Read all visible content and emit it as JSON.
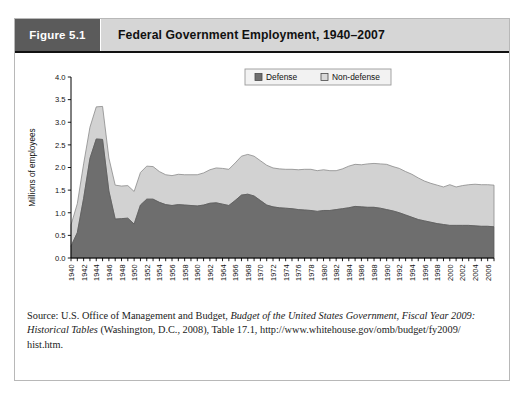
{
  "figure": {
    "badge_label": "Figure 5.1",
    "title": "Federal Government Employment, 1940–2007"
  },
  "source": {
    "line1_prefix": "Source: U.S. Office of Management and Budget, ",
    "line1_italic": "Budget of the United States Government, Fiscal Year 2009:",
    "line2_italic": "Historical Tables",
    "line2_rest": " (Washington, D.C., 2008), Table 17.1, http://www.whitehouse.gov/omb/budget/fy2009/",
    "line3": "hist.htm."
  },
  "chart_data": {
    "type": "area",
    "stacked": true,
    "title": "Federal Government Employment, 1940–2007",
    "xlabel": "",
    "ylabel": "Millions of employees",
    "ylim": [
      0,
      4.0
    ],
    "ytick_step": 0.5,
    "yticks": [
      "0.0",
      "0.5",
      "1.0",
      "1.5",
      "2.0",
      "2.5",
      "3.0",
      "3.5",
      "4.0"
    ],
    "xlim": [
      1940,
      2007
    ],
    "xticks": [
      1940,
      1942,
      1944,
      1946,
      1948,
      1950,
      1952,
      1954,
      1956,
      1958,
      1960,
      1962,
      1964,
      1966,
      1968,
      1970,
      1972,
      1974,
      1976,
      1978,
      1980,
      1982,
      1984,
      1986,
      1988,
      1990,
      1992,
      1994,
      1996,
      1998,
      2000,
      2002,
      2004,
      2006
    ],
    "xtick_rotation": 90,
    "grid": false,
    "legend_position": "top-right",
    "colors": {
      "defense": "#6e6e6e",
      "non_defense": "#d2d2d2"
    },
    "legend": [
      {
        "name": "Defense",
        "color": "#6e6e6e"
      },
      {
        "name": "Non-defense",
        "color": "#d9d9d9"
      }
    ],
    "x": [
      1940,
      1941,
      1942,
      1943,
      1944,
      1945,
      1946,
      1947,
      1948,
      1949,
      1950,
      1951,
      1952,
      1953,
      1954,
      1955,
      1956,
      1957,
      1958,
      1959,
      1960,
      1961,
      1962,
      1963,
      1964,
      1965,
      1966,
      1967,
      1968,
      1969,
      1970,
      1971,
      1972,
      1973,
      1974,
      1975,
      1976,
      1977,
      1978,
      1979,
      1980,
      1981,
      1982,
      1983,
      1984,
      1985,
      1986,
      1987,
      1988,
      1989,
      1990,
      1991,
      1992,
      1993,
      1994,
      1995,
      1996,
      1997,
      1998,
      1999,
      2000,
      2001,
      2002,
      2003,
      2004,
      2005,
      2006,
      2007
    ],
    "series": [
      {
        "name": "Defense",
        "values": [
          0.26,
          0.56,
          1.32,
          2.2,
          2.63,
          2.62,
          1.48,
          0.86,
          0.87,
          0.88,
          0.75,
          1.17,
          1.3,
          1.3,
          1.23,
          1.18,
          1.16,
          1.18,
          1.17,
          1.16,
          1.15,
          1.17,
          1.21,
          1.22,
          1.19,
          1.16,
          1.27,
          1.39,
          1.41,
          1.37,
          1.27,
          1.17,
          1.13,
          1.11,
          1.1,
          1.09,
          1.07,
          1.06,
          1.05,
          1.03,
          1.05,
          1.05,
          1.07,
          1.09,
          1.11,
          1.14,
          1.13,
          1.12,
          1.12,
          1.1,
          1.07,
          1.04,
          1.0,
          0.95,
          0.9,
          0.85,
          0.82,
          0.79,
          0.76,
          0.74,
          0.72,
          0.72,
          0.72,
          0.72,
          0.71,
          0.7,
          0.7,
          0.69
        ]
      },
      {
        "name": "Non-defense",
        "values": [
          0.47,
          0.64,
          0.76,
          0.69,
          0.71,
          0.73,
          0.73,
          0.75,
          0.72,
          0.72,
          0.72,
          0.72,
          0.73,
          0.72,
          0.68,
          0.66,
          0.66,
          0.67,
          0.67,
          0.68,
          0.69,
          0.71,
          0.74,
          0.77,
          0.79,
          0.8,
          0.83,
          0.86,
          0.88,
          0.88,
          0.88,
          0.88,
          0.86,
          0.86,
          0.86,
          0.87,
          0.88,
          0.9,
          0.91,
          0.9,
          0.9,
          0.88,
          0.86,
          0.88,
          0.92,
          0.93,
          0.93,
          0.96,
          0.97,
          0.98,
          1.0,
          0.98,
          0.98,
          0.96,
          0.95,
          0.92,
          0.88,
          0.86,
          0.85,
          0.83,
          0.9,
          0.85,
          0.88,
          0.9,
          0.92,
          0.92,
          0.92,
          0.92
        ]
      }
    ],
    "total_values": [
      0.73,
      1.2,
      2.08,
      2.89,
      3.34,
      3.35,
      2.21,
      1.61,
      1.59,
      1.6,
      1.47,
      1.89,
      2.03,
      2.02,
      1.91,
      1.84,
      1.82,
      1.85,
      1.84,
      1.84,
      1.84,
      1.88,
      1.95,
      1.99,
      1.98,
      1.96,
      2.1,
      2.25,
      2.29,
      2.25,
      2.15,
      2.05,
      1.99,
      1.97,
      1.96,
      1.96,
      1.95,
      1.96,
      1.96,
      1.93,
      1.95,
      1.93,
      1.93,
      1.97,
      2.03,
      2.07,
      2.06,
      2.08,
      2.09,
      2.08,
      2.07,
      2.02,
      1.98,
      1.91,
      1.85,
      1.77,
      1.7,
      1.65,
      1.61,
      1.57,
      1.62,
      1.57,
      1.6,
      1.62,
      1.63,
      1.62,
      1.62,
      1.61
    ]
  }
}
